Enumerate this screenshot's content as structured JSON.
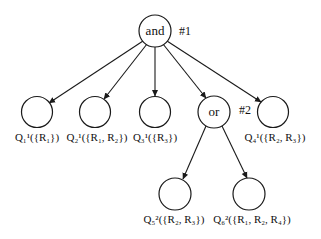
{
  "diagram": {
    "root": {
      "label": "and",
      "tag": "#1"
    },
    "or_node": {
      "label": "or",
      "tag": "#2"
    },
    "leaves": [
      {
        "q": "Q",
        "sup": "1",
        "sub": "1",
        "set": "({R",
        "items": [
          {
            "r": "R",
            "i": "1"
          }
        ],
        "text": "Q₁¹({R₁})"
      },
      {
        "q": "Q",
        "sup": "1",
        "sub": "2",
        "text": "Q₂¹({R₁, R₂})"
      },
      {
        "q": "Q",
        "sup": "1",
        "sub": "3",
        "text": "Q₃¹({R₃})"
      },
      {
        "q": "Q",
        "sup": "1",
        "sub": "4",
        "text": "Q₄¹({R₂, R₃})"
      },
      {
        "q": "Q",
        "sup": "2",
        "sub": "5",
        "text": "Q₅²({R₂, R₃})"
      },
      {
        "q": "Q",
        "sup": "2",
        "sub": "6",
        "text": "Q₆²({R₁, R₂, R₄})"
      }
    ],
    "line_color": "#1a1a1a",
    "background": "#ffffff"
  }
}
